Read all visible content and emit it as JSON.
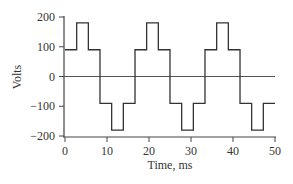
{
  "chart_data": {
    "type": "line",
    "title": "",
    "xlabel": "Time, ms",
    "ylabel": "Volts",
    "xlim": [
      0,
      50
    ],
    "ylim": [
      -200,
      200
    ],
    "xticks": [
      0,
      10,
      20,
      30,
      40,
      50
    ],
    "yticks": [
      200,
      100,
      0,
      -100,
      -200
    ],
    "xtick_labels": [
      "0",
      "10",
      "20",
      "30",
      "40",
      "50"
    ],
    "ytick_labels": [
      "200",
      "100",
      "0",
      "−100",
      "−200"
    ],
    "grid": false,
    "legend": null,
    "zero_line": true,
    "series": [
      {
        "name": "six-step voltage",
        "step": true,
        "x": [
          0,
          2.78,
          5.56,
          8.33,
          11.11,
          13.89,
          16.67,
          19.44,
          22.22,
          25.0,
          27.78,
          30.56,
          33.33,
          36.11,
          38.89,
          41.67,
          44.44,
          47.22,
          50.0
        ],
        "y": [
          90,
          180,
          90,
          -90,
          -180,
          -90,
          90,
          180,
          90,
          -90,
          -180,
          -90,
          90,
          180,
          90,
          -90,
          -180,
          -90,
          -90
        ]
      }
    ]
  }
}
